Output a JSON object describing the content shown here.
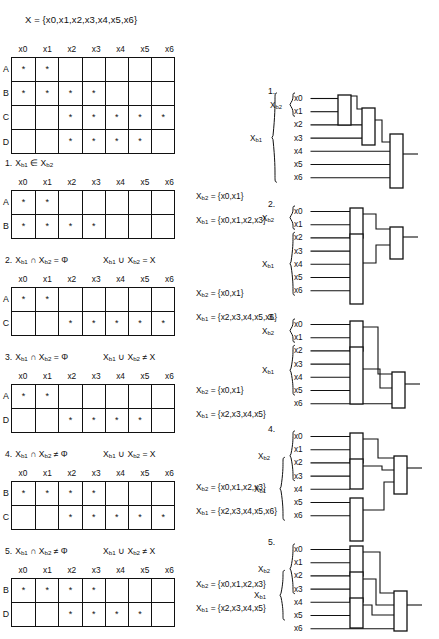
{
  "document": {
    "set_definition": "X = {x0,x1,x2,x3,x4,x5,x6}",
    "variables": [
      "x0",
      "x1",
      "x2",
      "x3",
      "x4",
      "x5",
      "x6"
    ],
    "master_table": {
      "columns": [
        "x0",
        "x1",
        "x2",
        "x3",
        "x4",
        "x5",
        "x6"
      ],
      "rows": [
        {
          "label": "A",
          "marks": [
            true,
            true,
            false,
            false,
            false,
            false,
            false
          ]
        },
        {
          "label": "B",
          "marks": [
            true,
            true,
            true,
            true,
            false,
            false,
            false
          ]
        },
        {
          "label": "C",
          "marks": [
            false,
            false,
            true,
            true,
            true,
            true,
            true
          ]
        },
        {
          "label": "D",
          "marks": [
            false,
            false,
            true,
            true,
            true,
            true,
            false
          ]
        }
      ]
    },
    "mark_symbol": "*",
    "cases": [
      {
        "number": "1.",
        "condition": "Xb1 ∈ Xb2",
        "condition_tokens": {
          "lhs": "X",
          "lhs_sub": "b1",
          "op": "∉",
          "rhs": "X",
          "rhs_sub": "b2"
        },
        "condition2": "",
        "columns": [
          "x0",
          "x1",
          "x2",
          "x3",
          "x4",
          "x5",
          "x6"
        ],
        "rows": [
          {
            "label": "A",
            "marks": [
              true,
              true,
              false,
              false,
              false,
              false,
              false
            ]
          },
          {
            "label": "B",
            "marks": [
              true,
              true,
              true,
              true,
              false,
              false,
              false
            ]
          }
        ],
        "set_xb2": "Xb2 = {x0,x1}",
        "set_xb1": "Xb1 = {x0,x1,x2,x3}"
      },
      {
        "number": "2.",
        "condition": "Xb1 ∩ Xb2 = Φ",
        "condition2": "Xb1 ∪ Xb2 = X",
        "columns": [
          "x0",
          "x1",
          "x2",
          "x3",
          "x4",
          "x5",
          "x6"
        ],
        "rows": [
          {
            "label": "A",
            "marks": [
              true,
              true,
              false,
              false,
              false,
              false,
              false
            ]
          },
          {
            "label": "C",
            "marks": [
              false,
              false,
              true,
              true,
              true,
              true,
              true
            ]
          }
        ],
        "set_xb2": "Xb2 = {x0,x1}",
        "set_xb1": "Xb1 = {x2,x3,x4,x5,x6}"
      },
      {
        "number": "3.",
        "condition": "Xb1 ∩ Xb2 = Φ",
        "condition2": "Xb1 ∪ Xb2 ≠ X",
        "columns": [
          "x0",
          "x1",
          "x2",
          "x3",
          "x4",
          "x5",
          "x6"
        ],
        "rows": [
          {
            "label": "A",
            "marks": [
              true,
              true,
              false,
              false,
              false,
              false,
              false
            ]
          },
          {
            "label": "D",
            "marks": [
              false,
              false,
              true,
              true,
              true,
              true,
              false
            ]
          }
        ],
        "set_xb2": "Xb2 = {x0,x1}",
        "set_xb1": "Xb1 = {x2,x3,x4,x5}"
      },
      {
        "number": "4.",
        "condition": "Xb1 ∩ Xb2 ≠ Φ",
        "condition2": "Xb1 ∪ Xb2 = X",
        "columns": [
          "x0",
          "x1",
          "x2",
          "x3",
          "x4",
          "x5",
          "x6"
        ],
        "rows": [
          {
            "label": "B",
            "marks": [
              true,
              true,
              true,
              true,
              false,
              false,
              false
            ]
          },
          {
            "label": "C",
            "marks": [
              false,
              false,
              true,
              true,
              true,
              true,
              true
            ]
          }
        ],
        "set_xb2": "Xb2 = {x0,x1,x2,x3}",
        "set_xb1": "Xb1 = {x2,x3,x4,x5,x6}"
      },
      {
        "number": "5.",
        "condition": "Xb1 ∩ Xb2 ≠ Φ",
        "condition2": "Xb1 ∪ Xb2 ≠ X",
        "columns": [
          "x0",
          "x1",
          "x2",
          "x3",
          "x4",
          "x5",
          "x6"
        ],
        "rows": [
          {
            "label": "B",
            "marks": [
              true,
              true,
              true,
              true,
              false,
              false,
              false
            ]
          },
          {
            "label": "D",
            "marks": [
              false,
              false,
              true,
              true,
              true,
              true,
              false
            ]
          }
        ],
        "set_xb2": "Xb2 = {x0,x1,x2,x3}",
        "set_xb1": "Xb1 = {x2,x3,x4,x5}"
      }
    ],
    "diagrams": [
      {
        "number": "1.",
        "inputs": [
          "x0",
          "x1",
          "x2",
          "x3",
          "x4",
          "x5",
          "x6"
        ],
        "bracket_labels": [
          "Xb1",
          "Xb2"
        ],
        "gate_count": 3
      },
      {
        "number": "2.",
        "inputs": [
          "x0",
          "x1",
          "x2",
          "x3",
          "x4",
          "x5",
          "x6"
        ],
        "bracket_labels": [
          "Xb2",
          "Xb1"
        ],
        "gate_count": 3
      },
      {
        "number": "3.",
        "inputs": [
          "x0",
          "x1",
          "x2",
          "x3",
          "x4",
          "x5",
          "x6"
        ],
        "bracket_labels": [
          "Xb2",
          "Xb1"
        ],
        "gate_count": 3
      },
      {
        "number": "4.",
        "inputs": [
          "x0",
          "x1",
          "x2",
          "x3",
          "x4",
          "x5",
          "x6"
        ],
        "bracket_labels": [
          "Xb2",
          "Xb1"
        ],
        "gate_count": 4
      },
      {
        "number": "5.",
        "inputs": [
          "x0",
          "x1",
          "x2",
          "x3",
          "x4",
          "x5",
          "x6"
        ],
        "bracket_labels": [
          "Xb2",
          "Xb1"
        ],
        "gate_count": 4
      }
    ]
  }
}
